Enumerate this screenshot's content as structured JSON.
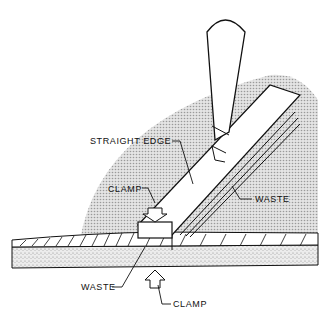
{
  "diagram": {
    "labels": {
      "straight_edge": "STRAIGHT EDGE",
      "clamp_top": "CLAMP",
      "waste_right": "WASTE",
      "waste_bottom": "WASTE",
      "clamp_bottom": "CLAMP"
    },
    "colors": {
      "ink": "#111111",
      "shade": "#c9c9c9",
      "background": "#ffffff"
    }
  }
}
